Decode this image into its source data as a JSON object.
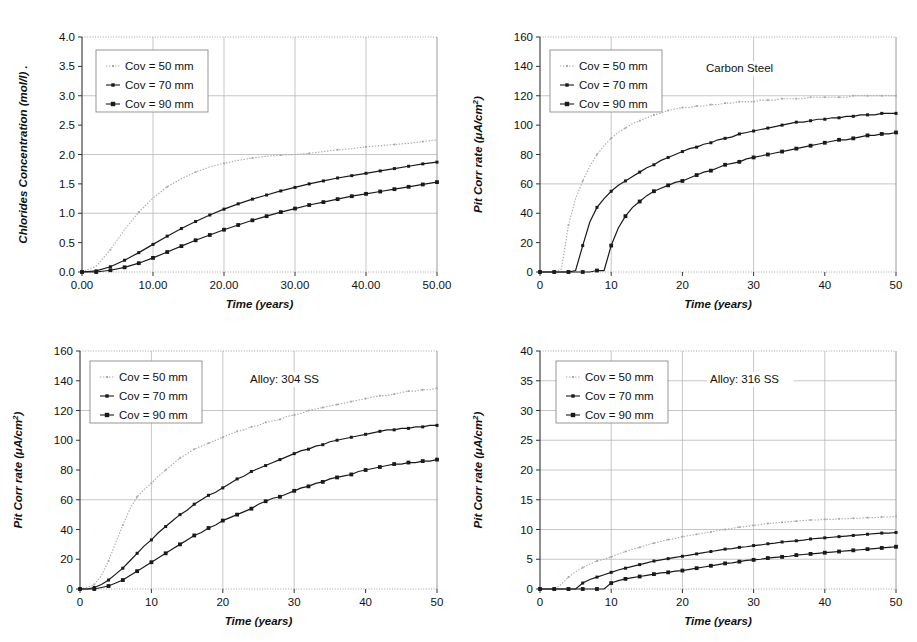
{
  "figure": {
    "title": "",
    "panels": [
      "chloride-concentration",
      "carbon-steel",
      "alloy-304-ss",
      "alloy-316-ss"
    ]
  },
  "legend": {
    "entries": [
      {
        "label": "Cov = 50 mm",
        "color": "#a8a8a8",
        "style": "dotted",
        "marker": "small-cross"
      },
      {
        "label": "Cov = 70 mm",
        "color": "#1a1a1a",
        "style": "solid",
        "marker": "small-diamond"
      },
      {
        "label": "Cov = 90 mm",
        "color": "#1a1a1a",
        "style": "solid",
        "marker": "square"
      }
    ]
  },
  "chart_data": [
    {
      "id": "chloride-concentration",
      "type": "line",
      "title": "",
      "annotation": "",
      "xlabel": "Time (years)",
      "ylabel": "Chlorides Concentration (mol/l) .",
      "xlim": [
        0,
        50
      ],
      "ylim": [
        0,
        4.0
      ],
      "xticks": [
        "0.00",
        "10.00",
        "20.00",
        "30.00",
        "40.00",
        "50.00"
      ],
      "xtick_values": [
        0,
        10,
        20,
        30,
        40,
        50
      ],
      "yticks": [
        "0.0",
        "0.5",
        "1.0",
        "1.5",
        "2.0",
        "2.5",
        "3.0",
        "3.5",
        "4.0"
      ],
      "ytick_values": [
        0,
        0.5,
        1.0,
        1.5,
        2.0,
        2.5,
        3.0,
        3.5,
        4.0
      ],
      "grid": {
        "horizontal": [
          1.0,
          2.0,
          3.0
        ],
        "vertical": [
          10,
          20,
          30,
          40
        ]
      },
      "x": [
        0,
        2,
        4,
        6,
        8,
        10,
        12,
        14,
        16,
        18,
        20,
        22,
        24,
        26,
        28,
        30,
        32,
        34,
        36,
        38,
        40,
        42,
        44,
        46,
        48,
        50
      ],
      "series": [
        {
          "name": "Cov = 50 mm",
          "color": "#a8a8a8",
          "style": "dotted",
          "values": [
            0.0,
            0.1,
            0.38,
            0.72,
            1.02,
            1.26,
            1.45,
            1.59,
            1.7,
            1.79,
            1.85,
            1.9,
            1.94,
            1.97,
            1.99,
            2.0,
            2.02,
            2.05,
            2.08,
            2.1,
            2.13,
            2.15,
            2.17,
            2.19,
            2.22,
            2.25
          ]
        },
        {
          "name": "Cov = 70 mm",
          "color": "#1a1a1a",
          "style": "solid",
          "values": [
            0.0,
            0.02,
            0.09,
            0.2,
            0.33,
            0.47,
            0.61,
            0.74,
            0.86,
            0.97,
            1.07,
            1.16,
            1.24,
            1.31,
            1.38,
            1.44,
            1.5,
            1.55,
            1.6,
            1.64,
            1.68,
            1.72,
            1.76,
            1.8,
            1.84,
            1.87
          ]
        },
        {
          "name": "Cov = 90 mm",
          "color": "#1a1a1a",
          "style": "solid",
          "values": [
            0.0,
            0.0,
            0.03,
            0.08,
            0.15,
            0.24,
            0.34,
            0.44,
            0.54,
            0.63,
            0.72,
            0.8,
            0.88,
            0.95,
            1.02,
            1.08,
            1.14,
            1.19,
            1.24,
            1.29,
            1.33,
            1.37,
            1.41,
            1.45,
            1.49,
            1.53
          ]
        }
      ]
    },
    {
      "id": "carbon-steel",
      "type": "line",
      "title": "",
      "annotation": "Carbon Steel",
      "xlabel": "Time (years)",
      "ylabel": "Pit Corr rate (μA/cm2)",
      "xlim": [
        0,
        50
      ],
      "ylim": [
        0,
        160
      ],
      "xticks": [
        "0",
        "10",
        "20",
        "30",
        "40",
        "50"
      ],
      "xtick_values": [
        0,
        10,
        20,
        30,
        40,
        50
      ],
      "yticks": [
        "0",
        "20",
        "40",
        "60",
        "80",
        "100",
        "120",
        "140",
        "160"
      ],
      "ytick_values": [
        0,
        20,
        40,
        60,
        80,
        100,
        120,
        140,
        160
      ],
      "grid": {
        "horizontal": [
          60,
          120
        ],
        "vertical": [
          10,
          30
        ]
      },
      "x": [
        0,
        1,
        2,
        3,
        4,
        5,
        6,
        7,
        8,
        9,
        10,
        11,
        12,
        13,
        14,
        15,
        16,
        17,
        18,
        19,
        20,
        21,
        22,
        23,
        24,
        25,
        26,
        27,
        28,
        29,
        30,
        31,
        32,
        33,
        34,
        35,
        36,
        37,
        38,
        39,
        40,
        41,
        42,
        43,
        44,
        45,
        46,
        47,
        48,
        49,
        50
      ],
      "series": [
        {
          "name": "Cov = 50 mm",
          "color": "#a8a8a8",
          "style": "dotted",
          "values": [
            0,
            0,
            0,
            2,
            32,
            50,
            62,
            72,
            80,
            86,
            91,
            95,
            98,
            101,
            103,
            105,
            107,
            108,
            110,
            111,
            112,
            112,
            113,
            113,
            114,
            114,
            115,
            115,
            116,
            116,
            116,
            117,
            117,
            117,
            118,
            118,
            118,
            118,
            119,
            119,
            119,
            119,
            119,
            119,
            120,
            120,
            120,
            120,
            120,
            120,
            120
          ]
        },
        {
          "name": "Cov = 70 mm",
          "color": "#1a1a1a",
          "style": "solid",
          "values": [
            0,
            0,
            0,
            0,
            0,
            1,
            18,
            34,
            44,
            50,
            55,
            59,
            62,
            65,
            68,
            71,
            73,
            76,
            78,
            80,
            82,
            84,
            85,
            87,
            88,
            90,
            91,
            92,
            94,
            95,
            96,
            97,
            98,
            99,
            100,
            101,
            102,
            102,
            103,
            104,
            104,
            105,
            105,
            106,
            106,
            107,
            107,
            107,
            108,
            108,
            108
          ]
        },
        {
          "name": "Cov = 90 mm",
          "color": "#1a1a1a",
          "style": "solid",
          "values": [
            0,
            0,
            0,
            0,
            0,
            0,
            0,
            0,
            1,
            1,
            18,
            30,
            38,
            44,
            48,
            52,
            55,
            57,
            59,
            61,
            62,
            64,
            66,
            68,
            69,
            71,
            73,
            74,
            75,
            77,
            78,
            79,
            80,
            81,
            82,
            83,
            84,
            85,
            86,
            87,
            88,
            89,
            90,
            90,
            91,
            92,
            93,
            93,
            94,
            94,
            95
          ]
        }
      ]
    },
    {
      "id": "alloy-304-ss",
      "type": "line",
      "title": "",
      "annotation": "Alloy: 304 SS",
      "xlabel": "Time (years)",
      "ylabel": "Pit Corr rate (μA/cm2)",
      "xlim": [
        0,
        50
      ],
      "ylim": [
        0,
        160
      ],
      "xticks": [
        "0",
        "10",
        "20",
        "30",
        "40",
        "50"
      ],
      "xtick_values": [
        0,
        10,
        20,
        30,
        40,
        50
      ],
      "yticks": [
        "0",
        "20",
        "40",
        "60",
        "80",
        "100",
        "120",
        "140",
        "160"
      ],
      "ytick_values": [
        0,
        20,
        40,
        60,
        80,
        100,
        120,
        140,
        160
      ],
      "grid": {
        "horizontal": [
          60,
          120
        ],
        "vertical": [
          10,
          20,
          30
        ]
      },
      "x": [
        0,
        1,
        2,
        3,
        4,
        5,
        6,
        7,
        8,
        9,
        10,
        11,
        12,
        13,
        14,
        15,
        16,
        17,
        18,
        19,
        20,
        21,
        22,
        23,
        24,
        25,
        26,
        27,
        28,
        29,
        30,
        31,
        32,
        33,
        34,
        35,
        36,
        37,
        38,
        39,
        40,
        41,
        42,
        43,
        44,
        45,
        46,
        47,
        48,
        49,
        50
      ],
      "series": [
        {
          "name": "Cov = 50 mm",
          "color": "#a8a8a8",
          "style": "dotted",
          "values": [
            0,
            1,
            3,
            9,
            19,
            31,
            43,
            54,
            62,
            67,
            71,
            76,
            80,
            84,
            88,
            91,
            94,
            96,
            98,
            100,
            102,
            104,
            106,
            107,
            109,
            110,
            112,
            113,
            114,
            116,
            117,
            118,
            120,
            121,
            122,
            123,
            124,
            125,
            126,
            127,
            128,
            129,
            130,
            130,
            131,
            132,
            133,
            133,
            134,
            134,
            135
          ]
        },
        {
          "name": "Cov = 70 mm",
          "color": "#1a1a1a",
          "style": "solid",
          "values": [
            0,
            0,
            1,
            3,
            6,
            10,
            14,
            19,
            24,
            29,
            33,
            38,
            42,
            46,
            50,
            53,
            57,
            60,
            63,
            65,
            68,
            71,
            74,
            76,
            79,
            81,
            83,
            85,
            87,
            89,
            91,
            93,
            94,
            96,
            97,
            99,
            100,
            101,
            102,
            103,
            104,
            105,
            106,
            107,
            107,
            108,
            108,
            109,
            109,
            110,
            110
          ]
        },
        {
          "name": "Cov = 90 mm",
          "color": "#1a1a1a",
          "style": "solid",
          "values": [
            0,
            0,
            0,
            1,
            2,
            4,
            6,
            9,
            12,
            15,
            18,
            21,
            24,
            27,
            30,
            33,
            36,
            38,
            41,
            43,
            46,
            48,
            50,
            52,
            54,
            57,
            59,
            61,
            62,
            64,
            66,
            68,
            69,
            71,
            72,
            74,
            75,
            76,
            77,
            79,
            80,
            81,
            82,
            83,
            84,
            84,
            85,
            85,
            86,
            86,
            87
          ]
        }
      ]
    },
    {
      "id": "alloy-316-ss",
      "type": "line",
      "title": "",
      "annotation": "Alloy: 316 SS",
      "xlabel": "Time (years)",
      "ylabel": "Pit Corr rate (μA/cm2)",
      "xlim": [
        0,
        50
      ],
      "ylim": [
        0,
        40
      ],
      "xticks": [
        "0",
        "10",
        "20",
        "30",
        "40",
        "50"
      ],
      "xtick_values": [
        0,
        10,
        20,
        30,
        40,
        50
      ],
      "yticks": [
        "0",
        "5",
        "10",
        "15",
        "20",
        "25",
        "30",
        "35",
        "40"
      ],
      "ytick_values": [
        0,
        5,
        10,
        15,
        20,
        25,
        30,
        35,
        40
      ],
      "grid": {
        "horizontal": [
          5,
          10,
          15,
          20,
          25,
          30,
          35
        ],
        "vertical": [
          10,
          20,
          30,
          40
        ]
      },
      "x": [
        0,
        1,
        2,
        3,
        4,
        5,
        6,
        7,
        8,
        9,
        10,
        11,
        12,
        13,
        14,
        15,
        16,
        17,
        18,
        19,
        20,
        21,
        22,
        23,
        24,
        25,
        26,
        27,
        28,
        29,
        30,
        31,
        32,
        33,
        34,
        35,
        36,
        37,
        38,
        39,
        40,
        41,
        42,
        43,
        44,
        45,
        46,
        47,
        48,
        49,
        50
      ],
      "series": [
        {
          "name": "Cov = 50 mm",
          "color": "#a8a8a8",
          "style": "dotted",
          "values": [
            0,
            0,
            0,
            0.8,
            2.0,
            2.9,
            3.6,
            4.2,
            4.7,
            5.0,
            5.4,
            5.9,
            6.3,
            6.7,
            7.0,
            7.4,
            7.7,
            8.0,
            8.3,
            8.5,
            8.8,
            9.0,
            9.2,
            9.4,
            9.6,
            9.8,
            10.0,
            10.2,
            10.4,
            10.5,
            10.7,
            10.8,
            11.0,
            11.1,
            11.2,
            11.3,
            11.4,
            11.5,
            11.6,
            11.6,
            11.7,
            11.7,
            11.8,
            11.8,
            11.9,
            11.9,
            12.0,
            12.0,
            12.1,
            12.1,
            12.2
          ]
        },
        {
          "name": "Cov = 70 mm",
          "color": "#1a1a1a",
          "style": "solid",
          "values": [
            0,
            0,
            0,
            0,
            0,
            0,
            1.0,
            1.6,
            2.0,
            2.4,
            2.8,
            3.2,
            3.5,
            3.8,
            4.1,
            4.4,
            4.7,
            4.9,
            5.1,
            5.3,
            5.5,
            5.7,
            5.9,
            6.1,
            6.3,
            6.5,
            6.7,
            6.8,
            7.0,
            7.1,
            7.3,
            7.4,
            7.6,
            7.7,
            7.9,
            8.0,
            8.1,
            8.2,
            8.4,
            8.5,
            8.6,
            8.7,
            8.8,
            8.9,
            9.0,
            9.1,
            9.2,
            9.3,
            9.4,
            9.4,
            9.5
          ]
        },
        {
          "name": "Cov = 90 mm",
          "color": "#1a1a1a",
          "style": "solid",
          "values": [
            0,
            0,
            0,
            0,
            0,
            0,
            0,
            0,
            0,
            0,
            1.0,
            1.4,
            1.7,
            1.9,
            2.1,
            2.3,
            2.5,
            2.7,
            2.8,
            3.0,
            3.1,
            3.3,
            3.5,
            3.7,
            3.9,
            4.1,
            4.3,
            4.4,
            4.6,
            4.8,
            4.9,
            5.0,
            5.2,
            5.3,
            5.4,
            5.5,
            5.7,
            5.8,
            5.9,
            6.0,
            6.1,
            6.2,
            6.3,
            6.4,
            6.5,
            6.6,
            6.7,
            6.8,
            6.9,
            7.0,
            7.1
          ]
        }
      ]
    }
  ]
}
